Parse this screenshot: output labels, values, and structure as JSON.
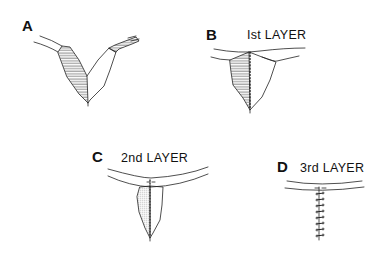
{
  "figure": {
    "line_color": "#222222",
    "background": "#ffffff",
    "panels": [
      {
        "id": "A",
        "letter": "A",
        "title": ""
      },
      {
        "id": "B",
        "letter": "B",
        "title": "Ist LAYER"
      },
      {
        "id": "C",
        "letter": "C",
        "title": "2nd LAYER"
      },
      {
        "id": "D",
        "letter": "D",
        "title": "3rd LAYER"
      }
    ]
  }
}
